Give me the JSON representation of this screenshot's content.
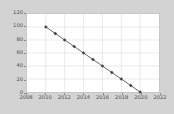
{
  "chart_data": {
    "type": "line",
    "title": "",
    "xlabel": "",
    "ylabel": "",
    "x": [
      2010,
      2011,
      2012,
      2013,
      2014,
      2015,
      2016,
      2017,
      2018,
      2019,
      2020
    ],
    "values": [
      100,
      90,
      80,
      70,
      60,
      50,
      40,
      30,
      20,
      10,
      0
    ],
    "series": [
      {
        "name": "series-1",
        "values": [
          100,
          90,
          80,
          70,
          60,
          50,
          40,
          30,
          20,
          10,
          0
        ]
      }
    ],
    "xlim": [
      2008,
      2022
    ],
    "ylim": [
      0,
      120
    ],
    "xticks": [
      2008,
      2010,
      2012,
      2014,
      2016,
      2018,
      2020,
      2022
    ],
    "xtick_labels": [
      "2008",
      "2010",
      "2012",
      "2014",
      "2016",
      "2018",
      "2020",
      "2022"
    ],
    "yticks": [
      0,
      20,
      40,
      60,
      80,
      100,
      120
    ],
    "ytick_labels": [
      "0",
      "20",
      "40",
      "60",
      "80",
      "100",
      "120"
    ],
    "grid": true,
    "legend": false,
    "legend_position": "none",
    "marker": "diamond",
    "colors": {
      "line": "#555555",
      "marker": "#444444",
      "figure_background": "#d3d3d3",
      "plot_background": "#ffffff",
      "grid": "#e0e0e0",
      "axis": "#c8c8c8",
      "tick_text": "#4d4d4d"
    }
  }
}
